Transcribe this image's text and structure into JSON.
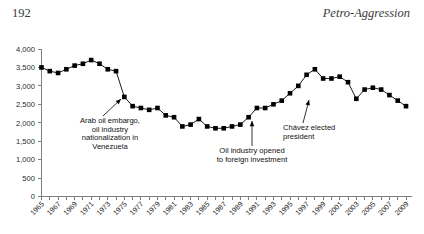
{
  "header": {
    "folio": "192",
    "running_title": "Petro-Aggression"
  },
  "chart_data": {
    "type": "line",
    "title": "",
    "xlabel": "",
    "ylabel": "",
    "ylim": [
      0,
      4000
    ],
    "ytick_values": [
      0,
      500,
      1000,
      1500,
      2000,
      2500,
      3000,
      3500,
      4000
    ],
    "ytick_labels": [
      "0",
      "500",
      "1,000",
      "1,500",
      "2,000",
      "2,500",
      "3,000",
      "3,500",
      "4,000"
    ],
    "xlim": [
      1965,
      2009
    ],
    "xtick_labels": [
      "1965",
      "1967",
      "1969",
      "1971",
      "1973",
      "1975",
      "1977",
      "1979",
      "1981",
      "1983",
      "1985",
      "1987",
      "1989",
      "1991",
      "1993",
      "1995",
      "1997",
      "1999",
      "2001",
      "2003",
      "2005",
      "2007",
      "2009"
    ],
    "grid": false,
    "legend": "none",
    "marker": "filled-square",
    "series_color": "#000000",
    "x": [
      1965,
      1966,
      1967,
      1968,
      1969,
      1970,
      1971,
      1972,
      1973,
      1974,
      1975,
      1976,
      1977,
      1978,
      1979,
      1980,
      1981,
      1982,
      1983,
      1984,
      1985,
      1986,
      1987,
      1988,
      1989,
      1990,
      1991,
      1992,
      1993,
      1994,
      1995,
      1996,
      1997,
      1998,
      1999,
      2000,
      2001,
      2002,
      2003,
      2004,
      2005,
      2006,
      2007,
      2008,
      2009
    ],
    "values": [
      3500,
      3400,
      3350,
      3450,
      3550,
      3600,
      3700,
      3600,
      3450,
      3400,
      2700,
      2450,
      2400,
      2350,
      2400,
      2200,
      2150,
      1900,
      1950,
      2100,
      1900,
      1850,
      1850,
      1900,
      1950,
      2150,
      2400,
      2400,
      2500,
      2600,
      2800,
      3000,
      3300,
      3450,
      3200,
      3200,
      3250,
      3100,
      2650,
      2900,
      2950,
      2900,
      2750,
      2600,
      2450
    ]
  },
  "annotations": [
    {
      "id": "arab-oil-embargo",
      "lines": [
        "Arab oil embargo,",
        "oil industry",
        "nationalization in",
        "Venezuela"
      ],
      "align": "center",
      "target_year": 1974,
      "target_value": 3400
    },
    {
      "id": "oil-industry-opened",
      "lines": [
        "Oil industry opened",
        "to foreign investment"
      ],
      "align": "center",
      "target_year": 1991,
      "target_value": 2400
    },
    {
      "id": "chavez-elected",
      "lines": [
        "Chávez elected",
        "president"
      ],
      "align": "left",
      "target_year": 1998,
      "target_value": 3450
    }
  ]
}
